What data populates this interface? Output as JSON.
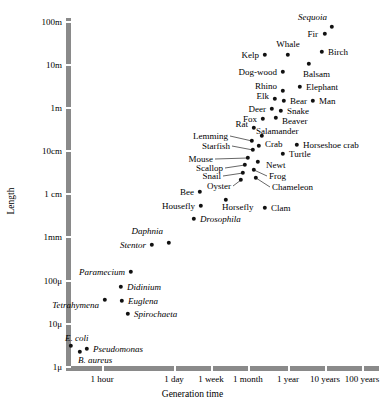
{
  "chart_data": {
    "type": "scatter",
    "title": "",
    "xlabel": "Generation time",
    "ylabel": "Length",
    "xscale": "log",
    "yscale": "log",
    "grid": false,
    "legend": null,
    "xticklabels": [
      "1 hour",
      "1 day",
      "1 week",
      "1 month",
      "1 year",
      "10 years",
      "100 years"
    ],
    "yticklabels": [
      "100m",
      "10m",
      "1m",
      "10cm",
      "1 cm",
      "1mm",
      "100μ",
      "10μ",
      "1μ"
    ],
    "ylim": [
      "1μ",
      "100m"
    ],
    "xlim": [
      "1 hour",
      "100 years"
    ],
    "points": [
      {
        "name": "Sequoia",
        "italic": true,
        "px": 332,
        "py": 27,
        "lx": 327,
        "ly": 17,
        "anchor": "r"
      },
      {
        "name": "Fir",
        "italic": false,
        "px": 325,
        "py": 34,
        "lx": 318,
        "ly": 34,
        "anchor": "r"
      },
      {
        "name": "Whale",
        "italic": false,
        "px": 288,
        "py": 55,
        "lx": 288,
        "ly": 44,
        "anchor": "c"
      },
      {
        "name": "Birch",
        "italic": false,
        "px": 322,
        "py": 52,
        "lx": 328,
        "ly": 52,
        "anchor": "l"
      },
      {
        "name": "Kelp",
        "italic": false,
        "px": 265,
        "py": 55,
        "lx": 259,
        "ly": 55,
        "anchor": "r"
      },
      {
        "name": "Balsam",
        "italic": false,
        "px": 309,
        "py": 64,
        "lx": 303,
        "ly": 74,
        "anchor": "l"
      },
      {
        "name": "Dog-wood",
        "italic": false,
        "px": 283,
        "py": 72,
        "lx": 277,
        "ly": 72,
        "anchor": "r"
      },
      {
        "name": "Elephant",
        "italic": false,
        "px": 300,
        "py": 87,
        "lx": 306,
        "ly": 87,
        "anchor": "l"
      },
      {
        "name": "Rhino",
        "italic": false,
        "px": 283,
        "py": 91,
        "lx": 277,
        "ly": 86,
        "anchor": "r"
      },
      {
        "name": "Elk",
        "italic": false,
        "px": 275,
        "py": 99,
        "lx": 269,
        "ly": 96,
        "anchor": "r"
      },
      {
        "name": "Bear",
        "italic": false,
        "px": 284,
        "py": 101,
        "lx": 290,
        "ly": 101,
        "anchor": "l"
      },
      {
        "name": "Man",
        "italic": false,
        "px": 313,
        "py": 101,
        "lx": 319,
        "ly": 101,
        "anchor": "l"
      },
      {
        "name": "Deer",
        "italic": false,
        "px": 272,
        "py": 109,
        "lx": 266,
        "ly": 109,
        "anchor": "r"
      },
      {
        "name": "Snake",
        "italic": false,
        "px": 281,
        "py": 111,
        "lx": 287,
        "ly": 111,
        "anchor": "l"
      },
      {
        "name": "Fox",
        "italic": false,
        "px": 263,
        "py": 119,
        "lx": 257,
        "ly": 119,
        "anchor": "r"
      },
      {
        "name": "Beaver",
        "italic": false,
        "px": 276,
        "py": 118,
        "lx": 282,
        "ly": 121,
        "anchor": "l"
      },
      {
        "name": "Rat",
        "italic": false,
        "px": 254,
        "py": 128,
        "lx": 248,
        "ly": 124,
        "anchor": "r"
      },
      {
        "name": "Salamander",
        "italic": false,
        "px": 262,
        "py": 136,
        "lx": 256,
        "ly": 131,
        "anchor": "l"
      },
      {
        "name": "Lemming",
        "italic": false,
        "px": 252,
        "py": 141,
        "lx": 228,
        "ly": 136,
        "anchor": "r",
        "leader": true
      },
      {
        "name": "Crab",
        "italic": false,
        "px": 259,
        "py": 146,
        "lx": 265,
        "ly": 144,
        "anchor": "l"
      },
      {
        "name": "Horseshoe crab",
        "italic": false,
        "px": 297,
        "py": 145,
        "lx": 303,
        "ly": 145,
        "anchor": "l"
      },
      {
        "name": "Starfish",
        "italic": false,
        "px": 253,
        "py": 150,
        "lx": 230,
        "ly": 146,
        "anchor": "r",
        "leader": true
      },
      {
        "name": "Turtle",
        "italic": false,
        "px": 283,
        "py": 154,
        "lx": 289,
        "ly": 154,
        "anchor": "l"
      },
      {
        "name": "Mouse",
        "italic": false,
        "px": 248,
        "py": 158,
        "lx": 213,
        "ly": 159,
        "anchor": "r",
        "leader": true
      },
      {
        "name": "Newt",
        "italic": false,
        "px": 258,
        "py": 162,
        "lx": 266,
        "ly": 165,
        "anchor": "l"
      },
      {
        "name": "Scallop",
        "italic": false,
        "px": 245,
        "py": 165,
        "lx": 223,
        "ly": 168,
        "anchor": "r",
        "leader": true
      },
      {
        "name": "Frog",
        "italic": false,
        "px": 254,
        "py": 170,
        "lx": 269,
        "ly": 176,
        "anchor": "l",
        "leader": true
      },
      {
        "name": "Snail",
        "italic": false,
        "px": 243,
        "py": 173,
        "lx": 221,
        "ly": 176,
        "anchor": "r",
        "leader": true
      },
      {
        "name": "Oyster",
        "italic": false,
        "px": 241,
        "py": 180,
        "lx": 231,
        "ly": 186,
        "anchor": "r",
        "leader": true
      },
      {
        "name": "Chameleon",
        "italic": false,
        "px": 256,
        "py": 178,
        "lx": 272,
        "ly": 187,
        "anchor": "l",
        "leader": true
      },
      {
        "name": "Bee",
        "italic": false,
        "px": 200,
        "py": 192,
        "lx": 194,
        "ly": 192,
        "anchor": "r"
      },
      {
        "name": "Housefly",
        "italic": false,
        "px": 201,
        "py": 206,
        "lx": 195,
        "ly": 206,
        "anchor": "r"
      },
      {
        "name": "Horsefly",
        "italic": false,
        "px": 226,
        "py": 200,
        "lx": 222,
        "ly": 207,
        "anchor": "l"
      },
      {
        "name": "Clam",
        "italic": false,
        "px": 265,
        "py": 208,
        "lx": 271,
        "ly": 208,
        "anchor": "l"
      },
      {
        "name": "Drosophila",
        "italic": true,
        "px": 194,
        "py": 219,
        "lx": 200,
        "ly": 219,
        "anchor": "l"
      },
      {
        "name": "Daphnia",
        "italic": true,
        "px": 169,
        "py": 243,
        "lx": 163,
        "ly": 231,
        "anchor": "r"
      },
      {
        "name": "Stentor",
        "italic": true,
        "px": 152,
        "py": 245,
        "lx": 146,
        "ly": 245,
        "anchor": "r"
      },
      {
        "name": "Paramecium",
        "italic": true,
        "px": 131,
        "py": 272,
        "lx": 125,
        "ly": 272,
        "anchor": "r"
      },
      {
        "name": "Didinium",
        "italic": true,
        "px": 121,
        "py": 287,
        "lx": 127,
        "ly": 287,
        "anchor": "l"
      },
      {
        "name": "Tetrahymena",
        "italic": true,
        "px": 105,
        "py": 300,
        "lx": 99,
        "ly": 305,
        "anchor": "r"
      },
      {
        "name": "Euglena",
        "italic": true,
        "px": 122,
        "py": 301,
        "lx": 128,
        "ly": 301,
        "anchor": "l"
      },
      {
        "name": "Spirochaeta",
        "italic": true,
        "px": 128,
        "py": 314,
        "lx": 134,
        "ly": 314,
        "anchor": "l"
      },
      {
        "name": "E. coli",
        "italic": true,
        "px": 71,
        "py": 346,
        "lx": 65,
        "ly": 338,
        "anchor": "l"
      },
      {
        "name": "B. aureus",
        "italic": true,
        "px": 80,
        "py": 352,
        "lx": 78,
        "ly": 360,
        "anchor": "l"
      },
      {
        "name": "Pseudomonas",
        "italic": true,
        "px": 87,
        "py": 349,
        "lx": 93,
        "ly": 349,
        "anchor": "l"
      }
    ]
  },
  "axes": {
    "y_title": "Length",
    "x_title": "Generation time",
    "y_ticks": [
      {
        "label": "100m",
        "y": 22
      },
      {
        "label": "10m",
        "y": 65
      },
      {
        "label": "1m",
        "y": 108
      },
      {
        "label": "10cm",
        "y": 151
      },
      {
        "label": "1 cm",
        "y": 194
      },
      {
        "label": "1mm",
        "y": 237
      },
      {
        "label": "100μ",
        "y": 281
      },
      {
        "label": "10μ",
        "y": 324
      },
      {
        "label": "1μ",
        "y": 367
      }
    ],
    "x_ticks": [
      {
        "label": "1 hour",
        "x": 102
      },
      {
        "label": "1 day",
        "x": 174
      },
      {
        "label": "1 week",
        "x": 211
      },
      {
        "label": "1 month",
        "x": 248
      },
      {
        "label": "1 year",
        "x": 288
      },
      {
        "label": "10 years",
        "x": 325
      },
      {
        "label": "100 years",
        "x": 362
      }
    ]
  },
  "colors": {
    "point": "#111111",
    "axis": "#8a8a8a",
    "text": "#000000",
    "background": "#ffffff"
  }
}
